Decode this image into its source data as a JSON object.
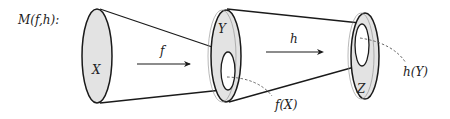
{
  "title": "M(f,h):",
  "sets": [
    {
      "id": "X",
      "label": "X"
    },
    {
      "id": "Y",
      "label": "Y"
    },
    {
      "id": "Z",
      "label": "Z"
    }
  ],
  "maps": [
    {
      "id": "f",
      "label": "f",
      "from": "X",
      "to": "Y"
    },
    {
      "id": "h",
      "label": "h",
      "from": "Y",
      "to": "Z"
    }
  ],
  "images": [
    {
      "id": "fX",
      "label": "f(X)"
    },
    {
      "id": "hY",
      "label": "h(Y)"
    }
  ],
  "colors": {
    "fill": "#e3e3e3",
    "stroke": "#1a1a1a",
    "dashed": "#555555"
  }
}
